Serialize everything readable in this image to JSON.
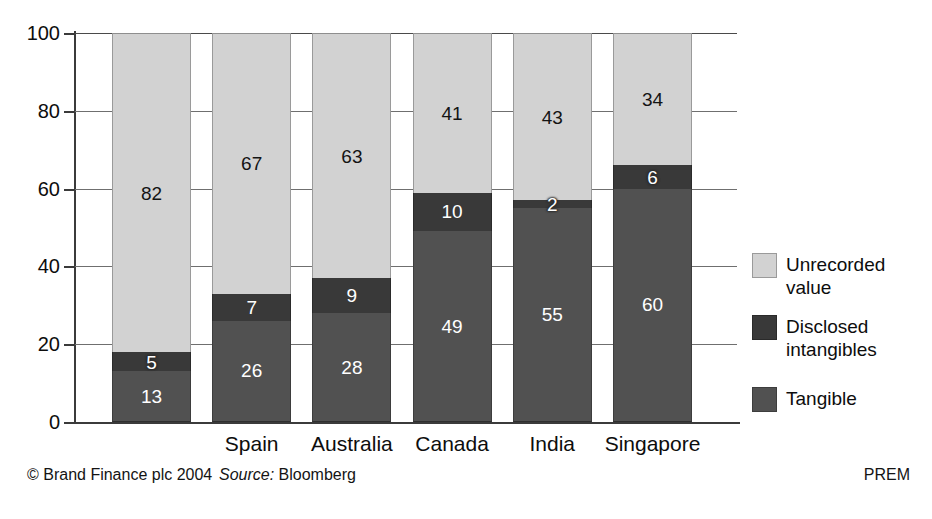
{
  "chart_data": {
    "type": "bar",
    "subtype": "stacked-100",
    "title": "",
    "xlabel": "",
    "ylabel": "",
    "ylim": [
      0,
      100
    ],
    "yticks": [
      0,
      20,
      40,
      60,
      80,
      100
    ],
    "ytick_labels": [
      "0",
      "20",
      "40",
      "60",
      "80",
      "100"
    ],
    "grid": true,
    "grid_axis": "y",
    "legend_position": "right",
    "categories": [
      "",
      "Spain",
      "Australia",
      "Canada",
      "India",
      "Singapore"
    ],
    "series": [
      {
        "name": "Tangible",
        "color": "#515151",
        "values": [
          13,
          26,
          28,
          49,
          55,
          60
        ]
      },
      {
        "name": "Disclosed intangibles",
        "color": "#393939",
        "values": [
          5,
          7,
          9,
          10,
          2,
          6
        ]
      },
      {
        "name": "Unrecorded value",
        "color": "#d2d2d2",
        "values": [
          82,
          67,
          63,
          41,
          43,
          34
        ]
      }
    ]
  },
  "axis": {
    "ytick_labels": [
      "100",
      "80",
      "60",
      "40",
      "20",
      "0"
    ]
  },
  "bars": [
    {
      "category": "",
      "segments": [
        {
          "series": "unrecorded",
          "value": "82"
        },
        {
          "series": "disclosed",
          "value": "5"
        },
        {
          "series": "tangible",
          "value": "13"
        }
      ]
    },
    {
      "category": "Spain",
      "segments": [
        {
          "series": "unrecorded",
          "value": "67"
        },
        {
          "series": "disclosed",
          "value": "7"
        },
        {
          "series": "tangible",
          "value": "26"
        }
      ]
    },
    {
      "category": "Australia",
      "segments": [
        {
          "series": "unrecorded",
          "value": "63"
        },
        {
          "series": "disclosed",
          "value": "9"
        },
        {
          "series": "tangible",
          "value": "28"
        }
      ]
    },
    {
      "category": "Canada",
      "segments": [
        {
          "series": "unrecorded",
          "value": "41"
        },
        {
          "series": "disclosed",
          "value": "10"
        },
        {
          "series": "tangible",
          "value": "49"
        }
      ]
    },
    {
      "category": "India",
      "segments": [
        {
          "series": "unrecorded",
          "value": "43"
        },
        {
          "series": "disclosed",
          "value": "2"
        },
        {
          "series": "tangible",
          "value": "55"
        }
      ]
    },
    {
      "category": "Singapore",
      "segments": [
        {
          "series": "unrecorded",
          "value": "34"
        },
        {
          "series": "disclosed",
          "value": "6"
        },
        {
          "series": "tangible",
          "value": "60"
        }
      ]
    }
  ],
  "legend": {
    "items": [
      {
        "label": "Unrecorded value",
        "swatch": "sw-unrecorded",
        "color": "#d2d2d2",
        "top": 0
      },
      {
        "label": "Disclosed intangibles",
        "swatch": "sw-disclosed",
        "color": "#393939",
        "top": 62
      },
      {
        "label": "Tangible",
        "swatch": "sw-tangible",
        "color": "#515151",
        "top": 134
      }
    ]
  },
  "footer": {
    "copyright": "© Brand Finance plc 2004",
    "source_keyword": "Source:",
    "source_name": "Bloomberg",
    "right_mark": "PREM"
  }
}
